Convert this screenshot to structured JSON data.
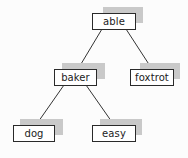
{
  "diagram": {
    "type": "binary-tree",
    "colors": {
      "background": "#fcfcfc",
      "node_border": "#2a2a2a",
      "node_fill": "#ffffff",
      "shadow": "#c9c9c9",
      "edge": "#333333",
      "text": "#222222"
    },
    "nodes": [
      {
        "id": "able",
        "label": "able",
        "x": 92,
        "y": 13,
        "w": 44
      },
      {
        "id": "baker",
        "label": "baker",
        "x": 54,
        "y": 69,
        "w": 43
      },
      {
        "id": "foxtrot",
        "label": "foxtrot",
        "x": 130,
        "y": 69,
        "w": 44
      },
      {
        "id": "dog",
        "label": "dog",
        "x": 13,
        "y": 125,
        "w": 42
      },
      {
        "id": "easy",
        "label": "easy",
        "x": 92,
        "y": 125,
        "w": 44
      }
    ],
    "edges": [
      {
        "from": "able",
        "to": "baker"
      },
      {
        "from": "able",
        "to": "foxtrot"
      },
      {
        "from": "baker",
        "to": "dog"
      },
      {
        "from": "baker",
        "to": "easy"
      }
    ]
  }
}
